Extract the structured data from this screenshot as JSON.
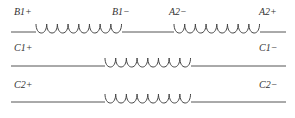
{
  "diagram": {
    "type": "winding-schematic",
    "colors": {
      "line": "#555555",
      "text": "#333333",
      "background": "#ffffff"
    },
    "rows": [
      {
        "id": "row-b1-a2",
        "coils": [
          {
            "name": "B1",
            "start_label": "B1+",
            "end_label": "B1−",
            "loops": 8
          },
          {
            "name": "A2",
            "start_label": "A2−",
            "end_label": "A2+",
            "loops": 8
          }
        ]
      },
      {
        "id": "row-c1",
        "coils": [
          {
            "name": "C1",
            "start_label": "C1+",
            "end_label": "C1−",
            "loops": 8
          }
        ]
      },
      {
        "id": "row-c2",
        "coils": [
          {
            "name": "C2",
            "start_label": "C2+",
            "end_label": "C2−",
            "loops": 8
          }
        ]
      }
    ],
    "labels": {
      "b1_plus": "B1+",
      "b1_minus": "B1−",
      "a2_minus": "A2−",
      "a2_plus": "A2+",
      "c1_plus": "C1+",
      "c1_minus": "C1−",
      "c2_plus": "C2+",
      "c2_minus": "C2−"
    }
  }
}
